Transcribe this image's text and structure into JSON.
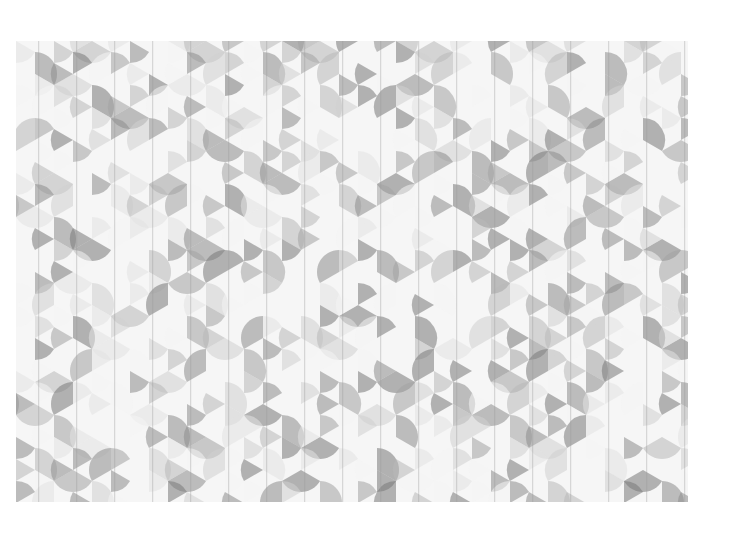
{
  "artwork": {
    "description": "Grayscale geometric tessellation of overlapping circular sectors on a hexagonal grid",
    "palette": [
      "#f4f4f4",
      "#e2e2e2",
      "#cfcfcf",
      "#b8b8b8",
      "#a2a2a2",
      "#8c8c8c",
      "#787878"
    ],
    "background": "#ffffff"
  }
}
